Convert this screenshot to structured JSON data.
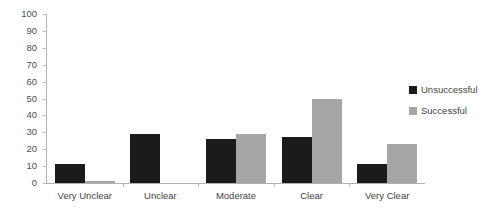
{
  "chart_data": {
    "type": "bar",
    "title": "",
    "subtitle": "",
    "xlabel": "",
    "ylabel": "",
    "categories": [
      "Very Unclear",
      "Unclear",
      "Moderate",
      "Clear",
      "Very Clear"
    ],
    "series": [
      {
        "name": "Unsuccessful",
        "color": "#1b1b1b",
        "values": [
          11,
          29,
          26,
          27,
          11
        ]
      },
      {
        "name": "Successful",
        "color": "#a6a6a6",
        "values": [
          1,
          0,
          29,
          50,
          23
        ]
      }
    ],
    "ylim": [
      0,
      100
    ],
    "ytick_step": 10,
    "yticks": [
      0,
      10,
      20,
      30,
      40,
      50,
      60,
      70,
      80,
      90,
      100
    ],
    "ytick_labels": [
      "0",
      "10",
      "20",
      "30",
      "40",
      "50",
      "60",
      "70",
      "80",
      "90",
      "100"
    ],
    "grid": false,
    "legend_position": "right"
  }
}
